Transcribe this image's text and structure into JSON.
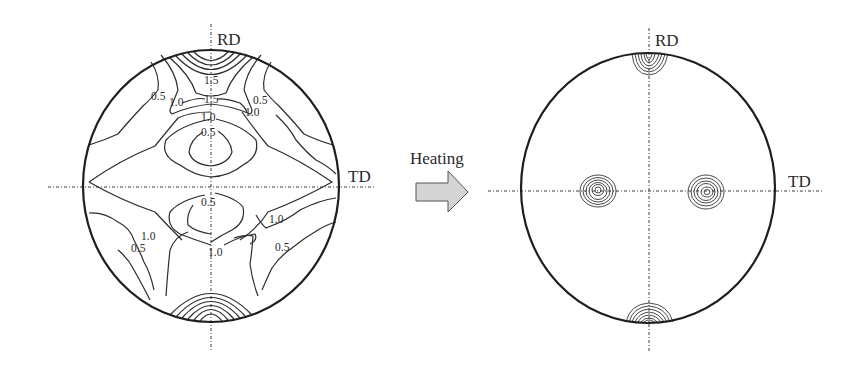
{
  "figure": {
    "before": {
      "axes": {
        "vertical": "RD",
        "horizontal": "TD"
      },
      "contour_levels": [
        "0.5",
        "1.0",
        "1.5"
      ],
      "contour_labels": {
        "top_center_upper": "1.5",
        "top_center_lower": "1.5",
        "upper_left_outer": "0.5",
        "upper_left_inner": "1.0",
        "upper_right_outer": "0.5",
        "upper_right_inner": "1.0",
        "upper_center_ring": "1.0",
        "upper_center_core": "0.5",
        "lower_center_core": "0.5",
        "lower_center_ring": "1.0",
        "lower_right_inner": "1.0",
        "lower_right_outer": "0.5",
        "lower_left_inner": "1.0",
        "lower_left_outer": "0.5"
      }
    },
    "transition": {
      "label": "Heating",
      "icon": "right-arrow-icon",
      "fill": "#d4d4d4"
    },
    "after": {
      "axes": {
        "vertical": "RD",
        "horizontal": "TD"
      },
      "poles": [
        "top",
        "bottom",
        "left-of-center",
        "right-of-center"
      ]
    }
  }
}
